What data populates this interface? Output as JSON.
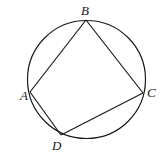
{
  "diagram": {
    "type": "inscribed-quadrilateral",
    "circle": {
      "cx": 86.5,
      "cy": 79.5,
      "r": 59
    },
    "points": {
      "A": {
        "label": "A",
        "x": 30,
        "y": 92,
        "label_x": 20,
        "label_y": 100
      },
      "B": {
        "label": "B",
        "x": 86,
        "y": 20,
        "label_x": 81,
        "label_y": 15
      },
      "C": {
        "label": "C",
        "x": 143,
        "y": 93,
        "label_x": 147,
        "label_y": 97
      },
      "D": {
        "label": "D",
        "x": 61,
        "y": 135,
        "label_x": 52,
        "label_y": 150
      }
    },
    "segments": [
      {
        "name": "segment-ab",
        "from": "A",
        "to": "B"
      },
      {
        "name": "segment-bc",
        "from": "B",
        "to": "C"
      },
      {
        "name": "segment-cd",
        "from": "C",
        "to": "D"
      },
      {
        "name": "segment-da",
        "from": "D",
        "to": "A"
      }
    ],
    "stroke_color": "#1a1a1a",
    "background": "#ffffff"
  }
}
